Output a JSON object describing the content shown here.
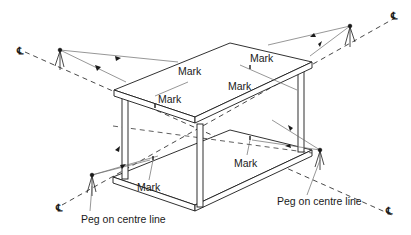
{
  "diagram": {
    "type": "isometric setting-out diagram",
    "labels": {
      "mark": "Mark",
      "peg_left": "Peg on centre line",
      "peg_right": "Peg on centre line",
      "centre_line_symbol": "℄"
    },
    "marks": [
      {
        "id": "mark-top-left-edge",
        "text": "Mark"
      },
      {
        "id": "mark-top-front-left",
        "text": "Mark"
      },
      {
        "id": "mark-top-right-edge",
        "text": "Mark"
      },
      {
        "id": "mark-top-front-right",
        "text": "Mark"
      },
      {
        "id": "mark-bottom-left",
        "text": "Mark"
      },
      {
        "id": "mark-bottom-right",
        "text": "Mark"
      }
    ],
    "centre_line_ends": [
      {
        "id": "cl-top-left",
        "text": "℄"
      },
      {
        "id": "cl-top-right",
        "text": "℄"
      },
      {
        "id": "cl-bottom-left",
        "text": "℄"
      },
      {
        "id": "cl-bottom-right",
        "text": "℄"
      }
    ],
    "colors": {
      "line": "#1a1a1a",
      "sight_line": "#6a6a6a",
      "background": "#ffffff"
    }
  }
}
